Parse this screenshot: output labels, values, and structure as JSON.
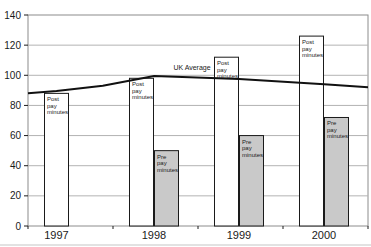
{
  "chart_data": {
    "type": "bar",
    "title": "",
    "xlabel": "",
    "ylabel": "",
    "categories": [
      "1997",
      "1998",
      "1999",
      "2000"
    ],
    "yticks": [
      0,
      20,
      40,
      60,
      80,
      100,
      120,
      140
    ],
    "ylim": [
      0,
      140
    ],
    "grid": true,
    "legend_position": "none",
    "series": [
      {
        "name": "Post pay minutes",
        "label_lines": [
          "Post",
          "pay",
          "minutes"
        ],
        "fill": "#ffffff",
        "values": [
          88,
          98,
          112,
          126
        ]
      },
      {
        "name": "Pre pay minutes",
        "label_lines": [
          "Pre",
          "pay",
          "minutes"
        ],
        "fill": "#c9c9c9",
        "values": [
          null,
          50,
          60,
          72
        ]
      }
    ],
    "line": {
      "name": "UK Average",
      "color": "#111111",
      "values_at_categories": [
        89.5,
        99.5,
        97.5,
        94
      ],
      "points": [
        [
          0,
          88
        ],
        [
          0.084,
          89.5
        ],
        [
          0.22,
          93
        ],
        [
          0.371,
          99.5
        ],
        [
          0.621,
          97.5
        ],
        [
          0.871,
          94
        ],
        [
          1,
          92
        ]
      ]
    },
    "colors": {
      "grid": "#b3b3b3",
      "plot_border": "#8c8c8c",
      "axis": "#1a1a1a",
      "bar_border": "#1a1a1a",
      "bottom_rule": "#d8d8d8"
    }
  }
}
